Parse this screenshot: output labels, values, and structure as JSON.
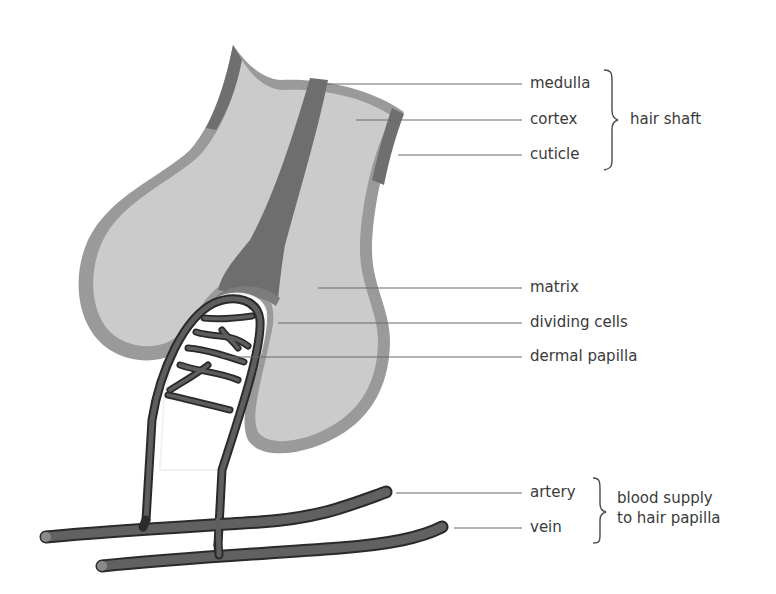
{
  "diagram": {
    "colors": {
      "shaft_fill": "#c8c8c8",
      "matrix_fill": "#cdcdcd",
      "outer_layer": "#9a9a9a",
      "medulla": "#6e6e6e",
      "cuticle": "#7a7a7a",
      "vessels": "#5e5e5e",
      "vessel_outline": "#2a2a2a",
      "leader_lines": "#6a6a6a",
      "text": "#3a3a3a"
    },
    "labels": {
      "medulla": "medulla",
      "cortex": "cortex",
      "cuticle": "cuticle",
      "matrix": "matrix",
      "dividing_cells": "dividing cells",
      "dermal_papilla": "dermal papilla",
      "artery": "artery",
      "vein": "vein"
    },
    "groups": {
      "hair_shaft": "hair shaft",
      "blood_supply_line1": "blood supply",
      "blood_supply_line2": "to hair papilla"
    }
  }
}
